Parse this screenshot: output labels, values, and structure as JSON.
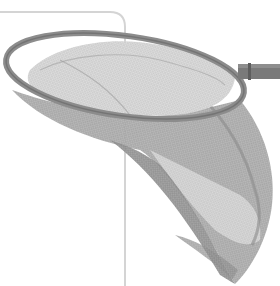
{
  "image": {
    "subject": "net-with-handle",
    "description": "Grayscale photo of a mesh net (butterfly / landing net) with an oval rim and a short straight handle extending to the right, in front of a thin rounded-corner frame line.",
    "palette": {
      "background": "#ffffff",
      "frame_line": "#d4d4d4",
      "rim": "#8c8c8c",
      "rim_dark": "#6e6e6e",
      "mesh_light": "#c8c8c8",
      "mesh_mid": "#a8a8a8",
      "mesh_dark": "#8a8a8a",
      "handle": "#7a7a7a"
    }
  }
}
